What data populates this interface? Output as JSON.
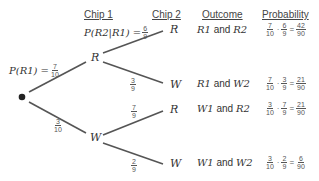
{
  "headers": {
    "chip1": "Chip 1",
    "chip2": "Chip 2",
    "outcome": "Outcome",
    "probability": "Probability"
  },
  "nodes": {
    "stage1": [
      {
        "label": "R",
        "x": 91,
        "y": 51
      },
      {
        "label": "W",
        "x": 90,
        "y": 131
      }
    ],
    "stage2": [
      {
        "label": "R",
        "x": 170,
        "y": 23
      },
      {
        "label": "W",
        "x": 170,
        "y": 78
      },
      {
        "label": "R",
        "x": 170,
        "y": 103
      },
      {
        "label": "W",
        "x": 170,
        "y": 157
      }
    ]
  },
  "branch_labels": {
    "root_to_R": {
      "prefix": "P(R1) = ",
      "num": "7",
      "den": "10"
    },
    "root_to_W": {
      "num": "3",
      "den": "10"
    },
    "R_to_R": {
      "prefix": "P(R2|R1) = ",
      "num": "6",
      "den": "9"
    },
    "R_to_W": {
      "num": "3",
      "den": "9"
    },
    "W_to_R": {
      "num": "7",
      "den": "9"
    },
    "W_to_W": {
      "num": "2",
      "den": "9"
    }
  },
  "rows": [
    {
      "outcome": {
        "a": "R1",
        "and": " and ",
        "b": "R2"
      },
      "prob": {
        "n1": "7",
        "d1": "10",
        "n2": "6",
        "d2": "9",
        "n3": "42",
        "d3": "90"
      }
    },
    {
      "outcome": {
        "a": "R1",
        "and": " and ",
        "b": "W2"
      },
      "prob": {
        "n1": "7",
        "d1": "10",
        "n2": "3",
        "d2": "9",
        "n3": "21",
        "d3": "90"
      }
    },
    {
      "outcome": {
        "a": "W1",
        "and": " and ",
        "b": "R2"
      },
      "prob": {
        "n1": "3",
        "d1": "10",
        "n2": "7",
        "d2": "9",
        "n3": "21",
        "d3": "90"
      }
    },
    {
      "outcome": {
        "a": "W1",
        "and": " and ",
        "b": "W2"
      },
      "prob": {
        "n1": "3",
        "d1": "10",
        "n2": "2",
        "d2": "9",
        "n3": "6",
        "d3": "90"
      }
    }
  ],
  "symbols": {
    "dot": "·",
    "eq": "="
  },
  "colors": {
    "line": "#555555",
    "text": "#333333"
  }
}
